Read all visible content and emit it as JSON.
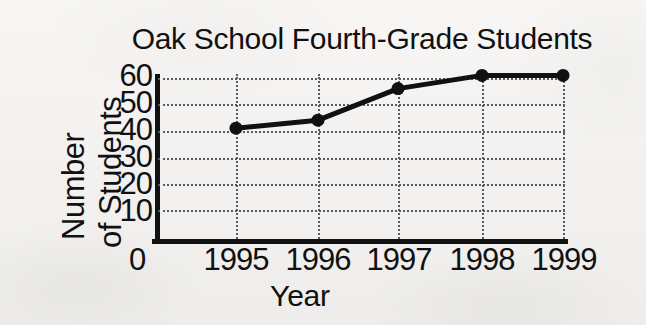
{
  "chart_data": {
    "type": "line",
    "title": "Oak School Fourth-Grade Students",
    "xlabel": "Year",
    "ylabel": "Number of Students",
    "ylabel_lines": [
      "Number",
      "of Students"
    ],
    "categories": [
      "1995",
      "1996",
      "1997",
      "1998",
      "1999"
    ],
    "values": [
      41,
      44,
      56,
      61,
      61
    ],
    "series": [
      {
        "name": "Number of Students",
        "values": [
          41,
          44,
          56,
          61,
          61
        ]
      }
    ],
    "x_tick_labels": [
      "0",
      "1995",
      "1996",
      "1997",
      "1998",
      "1999"
    ],
    "y_tick_labels": [
      "60",
      "50",
      "40",
      "30",
      "20",
      "10"
    ],
    "y_ticks": [
      10,
      20,
      30,
      40,
      50,
      60
    ],
    "ylim": [
      0,
      60
    ],
    "grid": "dotted horizontal and vertical gridlines",
    "legend": "none",
    "marker": "filled-circle",
    "line_color": "#111111",
    "grid_color": "#5a5a5a",
    "background_color": "#f4f3f1"
  }
}
